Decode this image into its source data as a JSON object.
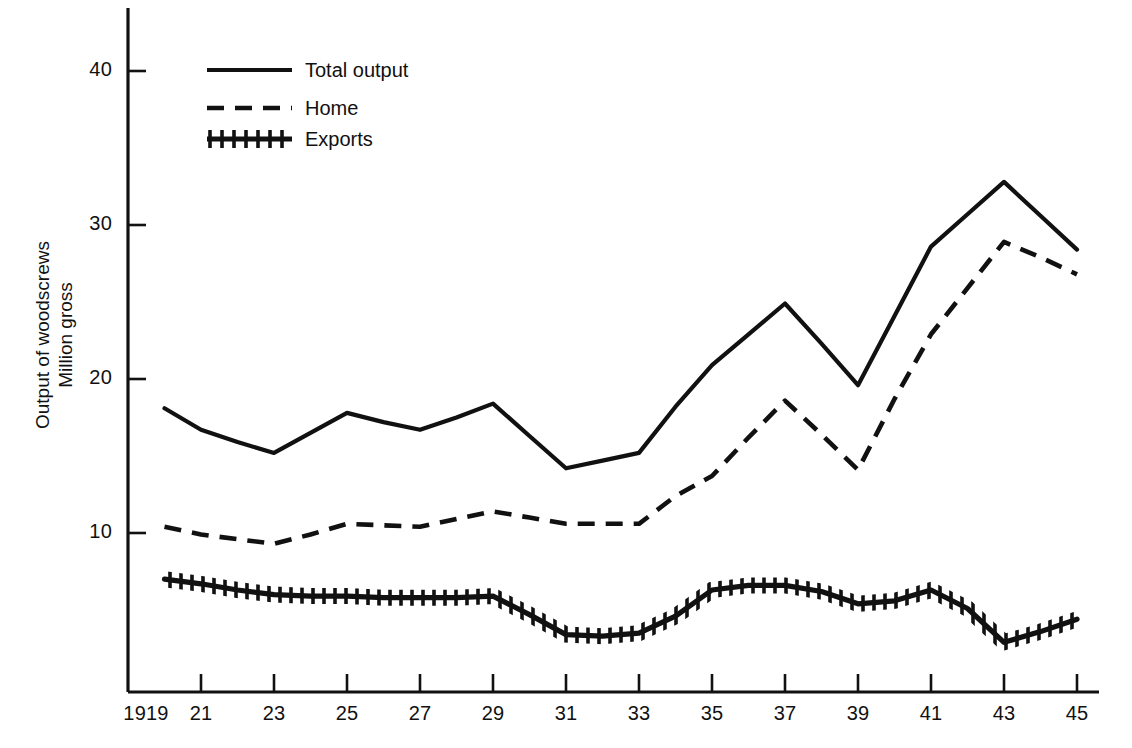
{
  "figure": {
    "background_color": "#ffffff",
    "ink_color": "#111111"
  },
  "axis": {
    "y_title_line1": "Output of woodscrews",
    "y_title_line2": "Million gross",
    "y_ticks": [
      "40",
      "30",
      "20",
      "10"
    ],
    "x_ticks": [
      "1919",
      "21",
      "23",
      "25",
      "27",
      "29",
      "31",
      "33",
      "35",
      "37",
      "39",
      "41",
      "43",
      "45"
    ]
  },
  "legend": {
    "items": [
      {
        "label": "Total output",
        "style": "solid"
      },
      {
        "label": "Home",
        "style": "dashed"
      },
      {
        "label": "Exports",
        "style": "hatched"
      }
    ]
  },
  "chart_data": {
    "type": "line",
    "title": "",
    "subtitle": "",
    "xlabel": "",
    "ylabel": "Output of woodscrews Million gross",
    "xlim": [
      1919,
      1945
    ],
    "ylim": [
      0,
      43
    ],
    "grid": false,
    "legend_position": "top-left",
    "x": [
      1920,
      1921,
      1922,
      1923,
      1924,
      1925,
      1926,
      1927,
      1928,
      1929,
      1930,
      1931,
      1932,
      1933,
      1934,
      1935,
      1936,
      1937,
      1938,
      1939,
      1940,
      1941,
      1942,
      1943,
      1944,
      1945
    ],
    "series": [
      {
        "name": "Total output",
        "style": "solid",
        "values": [
          18.1,
          16.7,
          15.9,
          15.2,
          16.5,
          17.8,
          17.2,
          16.7,
          17.5,
          18.4,
          16.3,
          14.2,
          14.7,
          15.2,
          18.2,
          20.9,
          22.9,
          24.9,
          22.3,
          19.6,
          24.1,
          28.6,
          30.7,
          32.8,
          30.6,
          28.4
        ]
      },
      {
        "name": "Home",
        "style": "dashed",
        "values": [
          10.4,
          9.9,
          9.6,
          9.3,
          9.9,
          10.6,
          10.5,
          10.4,
          10.9,
          11.4,
          11.0,
          10.6,
          10.6,
          10.6,
          12.4,
          13.7,
          16.2,
          18.6,
          16.4,
          14.1,
          18.7,
          22.9,
          25.9,
          28.9,
          27.9,
          26.8
        ]
      },
      {
        "name": "Exports",
        "style": "hatched",
        "values": [
          7.0,
          6.7,
          6.3,
          6.0,
          5.9,
          5.9,
          5.8,
          5.8,
          5.8,
          5.9,
          4.7,
          3.4,
          3.3,
          3.5,
          4.6,
          6.3,
          6.6,
          6.6,
          6.2,
          5.4,
          5.6,
          6.3,
          5.1,
          2.9,
          3.6,
          4.4
        ]
      }
    ]
  }
}
